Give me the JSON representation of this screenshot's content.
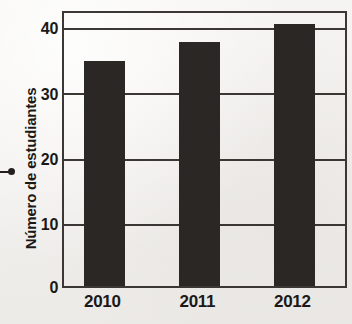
{
  "chart_data": {
    "type": "bar",
    "title": "",
    "subtitle": "",
    "xlabel": "",
    "ylabel": "Número de estudiantes",
    "categories": [
      "2010",
      "2011",
      "2012"
    ],
    "values": [
      34.5,
      37.5,
      40.2
    ],
    "series": [
      {
        "name": "Número de estudiantes",
        "values": [
          34.5,
          37.5,
          40.2
        ]
      }
    ],
    "ylim": [
      0,
      42.5
    ],
    "yticks": [
      0,
      10,
      20,
      30,
      40
    ],
    "ytick_labels": [
      "0",
      "10",
      "20",
      "30",
      "40"
    ],
    "grid": "horizontal",
    "legend": "none",
    "bar_color": "#2a2725",
    "axis_color": "#3a3735",
    "background_color": "#f4f2f0",
    "text_color": "#1b1917",
    "annotations": []
  },
  "marker": {
    "name": "left-pointer-bullet"
  }
}
